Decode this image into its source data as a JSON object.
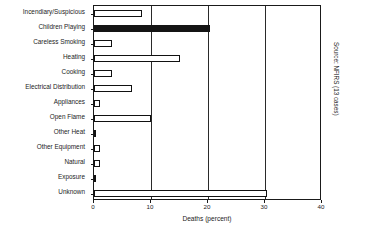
{
  "chart_data": {
    "type": "bar",
    "orientation": "horizontal",
    "title": "",
    "subtitle": "",
    "xlabel": "Deaths (percent)",
    "ylabel": "",
    "xlim": [
      0,
      40
    ],
    "xticks": [
      0,
      10,
      20,
      30,
      40
    ],
    "xtick_labels": [
      "0",
      "10",
      "20",
      "30",
      "40"
    ],
    "grid": true,
    "grid_axis": "x",
    "legend": null,
    "legend_position": "none",
    "annotations": [
      "Source: NFIRS (13 cases)"
    ],
    "categories": [
      "Incendiary/Suspicious",
      "Children Playing",
      "Careless Smoking",
      "Heating",
      "Cooking",
      "Electrical Distribution",
      "Appliances",
      "Open Flame",
      "Other Heat",
      "Other Equipment",
      "Natural",
      "Exposure",
      "Unknown"
    ],
    "values": [
      8.5,
      20.3,
      3.2,
      15.0,
      3.2,
      6.6,
      1.0,
      10.0,
      0.3,
      1.0,
      1.0,
      0.3,
      30.3
    ],
    "bar_styles": [
      "open",
      "filled",
      "open",
      "open",
      "open",
      "open",
      "open",
      "open",
      "open",
      "open",
      "open",
      "open",
      "open"
    ],
    "colors": {
      "bar_open_fill": "#ffffff",
      "bar_open_edge": "#111111",
      "bar_filled": "#141414",
      "axis": "#1a1a1a",
      "grid": "#2a2a2a",
      "text": "#1c1c1c",
      "background": "#ffffff"
    }
  },
  "source_note": "Source: NFIRS (13 cases)",
  "axis_title": "Deaths (percent)"
}
